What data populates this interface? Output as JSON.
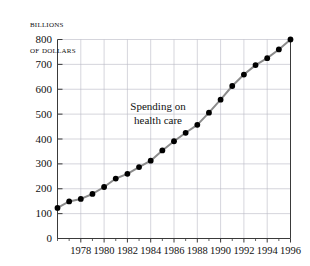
{
  "chart_data": {
    "type": "line",
    "title": "",
    "ylabel_lines": [
      "Billions",
      "of dollars"
    ],
    "xlabel": "",
    "annotation": [
      "Spending on",
      "health care"
    ],
    "x": [
      1976,
      1977,
      1978,
      1979,
      1980,
      1981,
      1982,
      1983,
      1984,
      1985,
      1986,
      1987,
      1988,
      1989,
      1990,
      1991,
      1992,
      1993,
      1994,
      1995,
      1996
    ],
    "values": [
      123,
      149,
      159,
      179,
      207,
      241,
      260,
      287,
      313,
      354,
      391,
      425,
      457,
      506,
      558,
      613,
      659,
      697,
      725,
      760,
      800
    ],
    "series": [
      {
        "name": "Spending on health care",
        "values": [
          123,
          149,
          159,
          179,
          207,
          241,
          260,
          287,
          313,
          354,
          391,
          425,
          457,
          506,
          558,
          613,
          659,
          697,
          725,
          760,
          800
        ]
      }
    ],
    "xlim": [
      1976,
      1996
    ],
    "ylim": [
      0,
      800
    ],
    "ytick_labels": [
      "0",
      "100",
      "200",
      "300",
      "400",
      "500",
      "600",
      "700",
      "800"
    ],
    "ytick_values": [
      0,
      100,
      200,
      300,
      400,
      500,
      600,
      700,
      800
    ],
    "xtick_labels": [
      "1978",
      "1980",
      "1982",
      "1984",
      "1986",
      "1988",
      "1990",
      "1992",
      "1994",
      "1996"
    ],
    "xtick_values": [
      1978,
      1980,
      1982,
      1984,
      1986,
      1988,
      1990,
      1992,
      1994,
      1996
    ],
    "xminor_values": [
      1976,
      1977,
      1979,
      1981,
      1983,
      1985,
      1987,
      1989,
      1991,
      1993,
      1995
    ],
    "grid": true,
    "legend": "none",
    "line_color": "#8c8c8c",
    "marker_color": "#000000",
    "grid_color": "#b9b9c4",
    "axis_color": "#3a3a3a"
  }
}
